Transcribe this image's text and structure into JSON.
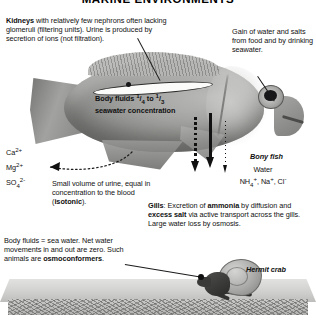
{
  "title": "MARINE ENVIRONMENTS",
  "labels": {
    "kidneys": {
      "lead_bold": "Kidneys",
      "rest": " with relatively few nephrons often lacking glomeruli (filtering units). Urine is produced by secretion of ions (not filtration)."
    },
    "gain": "Gain of water and salts from food and by drinking seawater.",
    "body_fluids": "Body fluids 1/4 to 1/3 seawater concentration",
    "body_fluids_parts": {
      "prefix": "Body fluids ",
      "frac1_num": "1",
      "frac1_den": "4",
      "middle": " to ",
      "frac2_num": "1",
      "frac2_den": "3",
      "suffix": "seawater concentration"
    },
    "ions": [
      {
        "element": "Ca",
        "charge": "2+",
        "sub": ""
      },
      {
        "element": "Mg",
        "charge": "2+",
        "sub": ""
      },
      {
        "element": "SO",
        "charge": "2-",
        "sub": "4"
      }
    ],
    "urine": {
      "text_a": "Small volume of urine, equal in concentration to the blood (",
      "bold": "isotonic",
      "text_b": ")."
    },
    "water_ions": {
      "line1": "Water",
      "line2_parts": {
        "nh4": "NH",
        "nh4_sub": "4",
        "nh4_charge": "+",
        "sep1": ", Na",
        "na_charge": "+",
        "sep2": ", Cl",
        "cl_charge": "-"
      }
    },
    "gills": {
      "lead_bold": "Gills",
      "seg_a": ": Excretion of ",
      "bold_a": "ammonia",
      "seg_b": " by diffusion and ",
      "bold_b": "excess salt",
      "seg_c": " via active transport across the gills. Large water loss by osmosis."
    },
    "osmoconformers": {
      "text_a": "Body fluids = sea water. Net water movements in and out are zero. Such animals are ",
      "bold": "osmoconformers",
      "text_b": "."
    },
    "bony_fish": "Bony fish",
    "hermit_crab": "Hermit crab"
  },
  "colors": {
    "background": "#ffffff",
    "text": "#111111",
    "line": "#1b1b1b",
    "organism_gray": "#9a9a98",
    "seafloor": "#c8c8c6"
  }
}
